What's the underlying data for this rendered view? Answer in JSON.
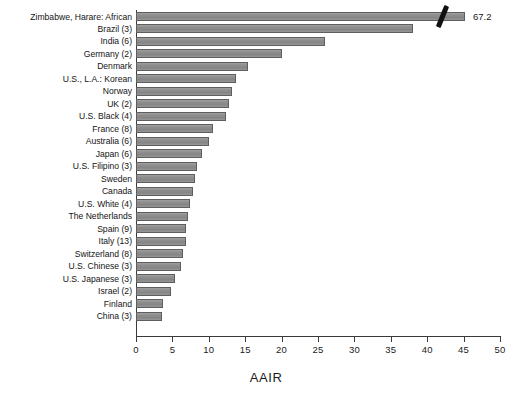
{
  "chart_data": {
    "type": "bar",
    "orientation": "horizontal",
    "title": "",
    "xlabel": "AAIR",
    "ylabel": "",
    "xlim": [
      0,
      50
    ],
    "xticks": [
      0,
      5,
      10,
      15,
      20,
      25,
      30,
      35,
      40,
      45,
      50
    ],
    "grid": false,
    "legend": null,
    "truncated_bar": {
      "category": "Zimbabwe, Harare: African",
      "actual_value": 67.2,
      "displayed_to": 45.2,
      "value_label": "67.2",
      "break_marker": "diagonal-slash"
    },
    "categories": [
      "Zimbabwe, Harare: African",
      "Brazil (3)",
      "India (6)",
      "Germany (2)",
      "Denmark",
      "U.S., L.A.: Korean",
      "Norway",
      "UK (2)",
      "U.S. Black (4)",
      "France (8)",
      "Australia (6)",
      "Japan (6)",
      "U.S. Filipino (3)",
      "Sweden",
      "Canada",
      "U.S. White (4)",
      "The Netherlands",
      "Spain (9)",
      "Italy (13)",
      "Switzerland (8)",
      "U.S. Chinese (3)",
      "U.S. Japanese (3)",
      "Israel (2)",
      "Finland",
      "China (3)"
    ],
    "values": [
      67.2,
      38.0,
      26.0,
      20.0,
      15.4,
      13.7,
      13.2,
      12.8,
      12.3,
      10.6,
      10.0,
      9.1,
      8.4,
      8.1,
      7.8,
      7.4,
      7.1,
      6.9,
      6.8,
      6.5,
      6.2,
      5.4,
      4.8,
      3.7,
      3.6
    ]
  },
  "axis": {
    "x_title": "AAIR",
    "tick_labels": [
      "0",
      "5",
      "10",
      "15",
      "20",
      "25",
      "30",
      "35",
      "40",
      "45",
      "50"
    ]
  },
  "style": {
    "bar_fill": "#8c8c8c",
    "bar_stroke": "#5e5e5e",
    "axis_color": "#3a3a3a",
    "text_color": "#1a1a1a",
    "background": "#ffffff"
  }
}
